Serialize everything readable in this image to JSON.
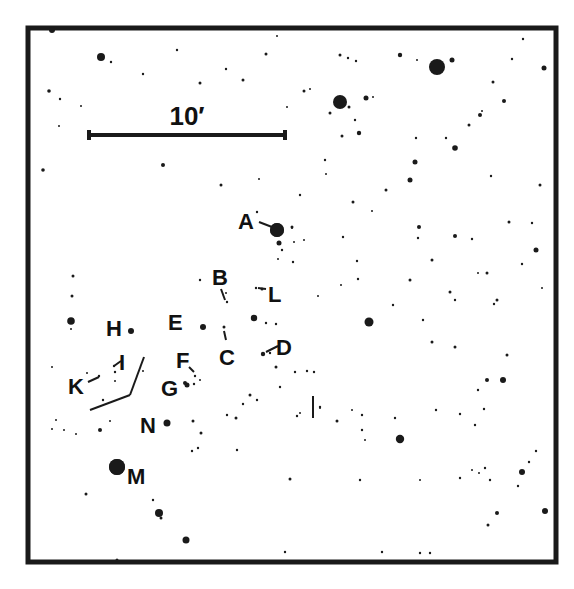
{
  "chart_data": {
    "type": "finder-chart",
    "title": "",
    "frame": {
      "x": 28,
      "y": 28,
      "w": 528,
      "h": 534,
      "stroke": 5
    },
    "scale_bar": {
      "label": "10′",
      "x1": 89,
      "x2": 285,
      "y": 135,
      "label_x": 187,
      "label_y": 125
    },
    "ink_color": "#1a1a1a",
    "stars": [
      [
        52,
        30,
        3
      ],
      [
        101,
        57,
        4
      ],
      [
        111,
        62,
        1.2
      ],
      [
        177,
        50,
        1.2
      ],
      [
        143,
        74,
        1.2
      ],
      [
        49,
        91,
        1.8
      ],
      [
        60,
        99,
        1.2
      ],
      [
        81,
        106,
        1
      ],
      [
        59,
        126,
        1
      ],
      [
        226,
        69,
        1.2
      ],
      [
        200,
        83,
        1.5
      ],
      [
        243,
        80,
        1.5
      ],
      [
        266,
        54,
        1.5
      ],
      [
        277,
        36,
        1
      ],
      [
        287,
        107,
        1
      ],
      [
        43,
        170,
        1.8
      ],
      [
        163,
        165,
        2
      ],
      [
        221,
        185,
        1.5
      ],
      [
        259,
        179,
        1
      ],
      [
        340,
        55,
        1.5
      ],
      [
        348,
        58,
        1.2
      ],
      [
        356,
        61,
        1.2
      ],
      [
        400,
        55,
        2.2
      ],
      [
        417,
        60,
        1
      ],
      [
        437,
        67,
        8
      ],
      [
        452,
        60,
        2.5
      ],
      [
        523,
        39,
        1.2
      ],
      [
        512,
        59,
        1.2
      ],
      [
        544,
        68,
        2.5
      ],
      [
        493,
        82,
        1.5
      ],
      [
        304,
        91,
        1.5
      ],
      [
        310,
        89,
        1
      ],
      [
        340,
        102,
        7
      ],
      [
        349,
        107,
        1.5
      ],
      [
        366,
        98,
        2.5
      ],
      [
        373,
        97,
        1
      ],
      [
        330,
        113,
        1.5
      ],
      [
        355,
        120,
        1.2
      ],
      [
        342,
        136,
        1.5
      ],
      [
        359,
        133,
        2.2
      ],
      [
        455,
        148,
        2.8
      ],
      [
        415,
        162,
        2.5
      ],
      [
        469,
        125,
        1.5
      ],
      [
        416,
        138,
        1.2
      ],
      [
        446,
        138,
        1.2
      ],
      [
        504,
        101,
        2
      ],
      [
        480,
        115,
        2
      ],
      [
        482,
        111,
        1
      ],
      [
        326,
        174,
        1
      ],
      [
        325,
        160,
        1.2
      ],
      [
        386,
        190,
        1.5
      ],
      [
        491,
        176,
        1.2
      ],
      [
        540,
        185,
        1.5
      ],
      [
        410,
        180,
        2.5
      ],
      [
        277,
        230,
        7
      ],
      [
        279,
        243,
        2.5
      ],
      [
        292,
        227,
        1.5
      ],
      [
        294,
        242,
        1
      ],
      [
        304,
        240,
        1
      ],
      [
        282,
        250,
        1.2
      ],
      [
        278,
        259,
        1
      ],
      [
        293,
        262,
        1.2
      ],
      [
        257,
        212,
        1.2
      ],
      [
        300,
        195,
        1.2
      ],
      [
        353,
        202,
        1.5
      ],
      [
        372,
        211,
        1
      ],
      [
        419,
        227,
        2
      ],
      [
        418,
        238,
        1.2
      ],
      [
        455,
        236,
        2
      ],
      [
        472,
        239,
        1.2
      ],
      [
        509,
        222,
        1.5
      ],
      [
        532,
        223,
        1.2
      ],
      [
        343,
        237,
        1.2
      ],
      [
        292,
        228,
        1
      ],
      [
        200,
        280,
        1.2
      ],
      [
        262,
        289,
        1.5
      ],
      [
        226,
        293,
        1
      ],
      [
        318,
        296,
        1
      ],
      [
        341,
        285,
        1
      ],
      [
        358,
        279,
        1.2
      ],
      [
        357,
        261,
        1.2
      ],
      [
        410,
        280,
        1.5
      ],
      [
        432,
        260,
        1.5
      ],
      [
        450,
        292,
        1.5
      ],
      [
        455,
        300,
        1.2
      ],
      [
        536,
        250,
        2.5
      ],
      [
        522,
        264,
        1.2
      ],
      [
        487,
        273,
        1.5
      ],
      [
        478,
        273,
        1
      ],
      [
        497,
        300,
        1.5
      ],
      [
        542,
        288,
        1
      ],
      [
        254,
        318,
        3.2
      ],
      [
        266,
        323,
        1.2
      ],
      [
        276,
        324,
        1.2
      ],
      [
        270,
        353,
        1.2
      ],
      [
        276,
        367,
        1.5
      ],
      [
        295,
        372,
        1.2
      ],
      [
        307,
        371,
        1.2
      ],
      [
        314,
        372,
        1.2
      ],
      [
        369,
        322,
        4.5
      ],
      [
        393,
        305,
        1.2
      ],
      [
        423,
        320,
        1.2
      ],
      [
        455,
        347,
        1.5
      ],
      [
        432,
        342,
        1.5
      ],
      [
        494,
        304,
        1.2
      ],
      [
        487,
        380,
        2
      ],
      [
        503,
        380,
        3
      ],
      [
        507,
        355,
        1.5
      ],
      [
        478,
        390,
        1.2
      ],
      [
        250,
        395,
        1.5
      ],
      [
        257,
        400,
        1.2
      ],
      [
        243,
        404,
        1.2
      ],
      [
        236,
        418,
        1.5
      ],
      [
        320,
        407,
        1.2
      ],
      [
        337,
        421,
        1.5
      ],
      [
        362,
        415,
        1.2
      ],
      [
        395,
        418,
        1.2
      ],
      [
        365,
        440,
        1
      ],
      [
        300,
        413,
        1
      ],
      [
        71,
        321,
        3.8
      ],
      [
        71,
        329,
        1
      ],
      [
        72,
        296,
        1.5
      ],
      [
        73,
        276,
        1.5
      ],
      [
        52,
        367,
        1
      ],
      [
        103,
        400,
        1.2
      ],
      [
        115,
        372,
        1.2
      ],
      [
        87,
        373,
        1
      ],
      [
        100,
        430,
        2
      ],
      [
        76,
        434,
        1
      ],
      [
        56,
        420,
        1
      ],
      [
        52,
        429,
        1
      ],
      [
        110,
        421,
        1
      ],
      [
        115,
        381,
        1
      ],
      [
        143,
        371,
        1
      ],
      [
        64,
        430,
        1
      ],
      [
        185,
        383,
        2
      ],
      [
        194,
        384,
        1.2
      ],
      [
        200,
        380,
        1
      ],
      [
        193,
        421,
        1.5
      ],
      [
        201,
        433,
        1.5
      ],
      [
        198,
        448,
        1.2
      ],
      [
        192,
        451,
        1.2
      ],
      [
        227,
        415,
        1.2
      ],
      [
        237,
        450,
        1.2
      ],
      [
        280,
        387,
        1.2
      ],
      [
        297,
        416,
        1.2
      ],
      [
        117,
        467,
        8
      ],
      [
        86,
        494,
        1.5
      ],
      [
        153,
        500,
        1.2
      ],
      [
        159,
        513,
        4
      ],
      [
        161,
        518,
        1.5
      ],
      [
        186,
        540,
        3.5
      ],
      [
        285,
        552,
        1.2
      ],
      [
        117,
        560,
        1.5
      ],
      [
        290,
        479,
        1.5
      ],
      [
        320,
        408,
        1
      ],
      [
        352,
        410,
        1
      ],
      [
        362,
        430,
        1.2
      ],
      [
        400,
        439,
        4.2
      ],
      [
        360,
        480,
        1.2
      ],
      [
        420,
        480,
        1
      ],
      [
        460,
        478,
        1.2
      ],
      [
        472,
        470,
        1
      ],
      [
        485,
        468,
        1.2
      ],
      [
        479,
        473,
        1
      ],
      [
        490,
        480,
        1.2
      ],
      [
        522,
        472,
        3
      ],
      [
        536,
        451,
        1.2
      ],
      [
        529,
        462,
        1.2
      ],
      [
        497,
        513,
        2
      ],
      [
        488,
        525,
        1.5
      ],
      [
        545,
        511,
        3
      ],
      [
        382,
        552,
        1.2
      ],
      [
        420,
        553,
        1.2
      ],
      [
        430,
        553,
        1.2
      ],
      [
        436,
        410,
        1.2
      ],
      [
        484,
        409,
        1.2
      ],
      [
        460,
        414,
        1.2
      ],
      [
        518,
        486,
        1.2
      ],
      [
        475,
        425,
        1.2
      ]
    ],
    "labeled_stars": [
      {
        "id": "A",
        "label_x": 238,
        "label_y": 229,
        "star": [
          277,
          230,
          7
        ],
        "leader": [
          [
            259,
            222
          ],
          [
            272,
            227
          ]
        ]
      },
      {
        "id": "B",
        "label_x": 212,
        "label_y": 285,
        "star": [
          227,
          302,
          1.2
        ],
        "leader": [
          [
            221,
            289
          ],
          [
            225,
            300
          ]
        ]
      },
      {
        "id": "C",
        "label_x": 219,
        "label_y": 365,
        "star": [
          224,
          327,
          1.5
        ],
        "leader": [
          [
            224,
            331
          ],
          [
            226,
            340
          ]
        ]
      },
      {
        "id": "D",
        "label_x": 276,
        "label_y": 355,
        "star": [
          263,
          354,
          2.2
        ],
        "leader": [
          [
            266,
            352
          ],
          [
            278,
            346
          ]
        ]
      },
      {
        "id": "E",
        "label_x": 168,
        "label_y": 330,
        "star": [
          203,
          327,
          3
        ],
        "leader": null
      },
      {
        "id": "F",
        "label_x": 176,
        "label_y": 368,
        "star": [
          195,
          376,
          1.2
        ],
        "leader": [
          [
            189,
            367
          ],
          [
            194,
            372
          ]
        ]
      },
      {
        "id": "G",
        "label_x": 161,
        "label_y": 396,
        "star": [
          187,
          385,
          2.5
        ],
        "leader": null
      },
      {
        "id": "H",
        "label_x": 106,
        "label_y": 336,
        "star": [
          131,
          331,
          3
        ],
        "leader": null
      },
      {
        "id": "I",
        "label_x": 119,
        "label_y": 370,
        "star": [
          114,
          366,
          1.2
        ],
        "leader": [
          [
            114,
            366
          ],
          [
            121,
            361
          ]
        ]
      },
      {
        "id": "K",
        "label_x": 68,
        "label_y": 394,
        "star": [
          99,
          376,
          1.2
        ],
        "leader": [
          [
            88,
            382
          ],
          [
            99,
            377
          ]
        ]
      },
      {
        "id": "L",
        "label_x": 268,
        "label_y": 302,
        "star": [
          256,
          288,
          1.2
        ],
        "leader": [
          [
            258,
            288
          ],
          [
            266,
            289
          ]
        ]
      },
      {
        "id": "M",
        "label_x": 127,
        "label_y": 484,
        "star": [
          117,
          467,
          8
        ],
        "leader": null
      },
      {
        "id": "N",
        "label_x": 140,
        "label_y": 433,
        "star": [
          167,
          423,
          3.5
        ],
        "leader": null
      }
    ],
    "marker_lines": [
      [
        [
          144,
          357
        ],
        [
          130,
          395
        ]
      ],
      [
        [
          130,
          395
        ],
        [
          90,
          410
        ]
      ],
      [
        [
          313,
          396
        ],
        [
          313,
          418
        ]
      ]
    ]
  }
}
